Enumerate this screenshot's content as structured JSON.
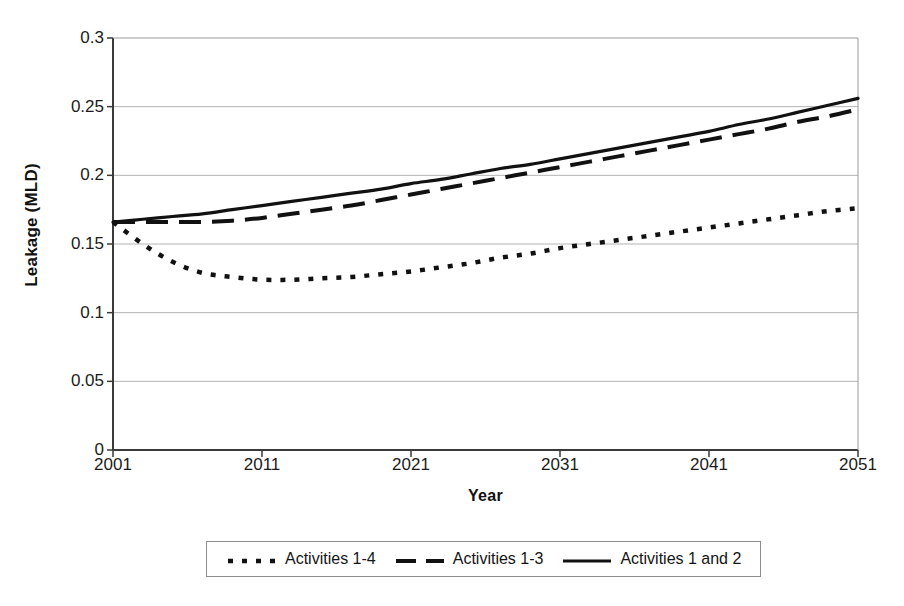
{
  "chart_data": {
    "type": "line",
    "title": "",
    "xlabel": "Year",
    "ylabel": "Leakage (MLD)",
    "xlim": [
      2001,
      2051
    ],
    "ylim": [
      0,
      0.3
    ],
    "grid": true,
    "legend_position": "bottom",
    "x_ticks": [
      "2001",
      "2011",
      "2021",
      "2031",
      "2041",
      "2051"
    ],
    "y_ticks": [
      "0",
      "0.05",
      "0.1",
      "0.15",
      "0.2",
      "0.25",
      "0.3"
    ],
    "x": [
      2001,
      2003,
      2005,
      2007,
      2009,
      2011,
      2013,
      2015,
      2017,
      2019,
      2021,
      2023,
      2025,
      2027,
      2029,
      2031,
      2033,
      2035,
      2037,
      2039,
      2041,
      2043,
      2045,
      2047,
      2049,
      2051
    ],
    "series": [
      {
        "name": "Activities 1-4",
        "style": "dotted",
        "color": "#111111",
        "values": [
          0.166,
          0.15,
          0.137,
          0.129,
          0.126,
          0.124,
          0.124,
          0.125,
          0.126,
          0.128,
          0.13,
          0.133,
          0.136,
          0.14,
          0.143,
          0.147,
          0.15,
          0.153,
          0.156,
          0.159,
          0.162,
          0.165,
          0.168,
          0.171,
          0.174,
          0.176
        ]
      },
      {
        "name": "Activities 1-3",
        "style": "dashed",
        "color": "#111111",
        "values": [
          0.166,
          0.166,
          0.166,
          0.166,
          0.167,
          0.169,
          0.172,
          0.175,
          0.178,
          0.182,
          0.186,
          0.19,
          0.194,
          0.198,
          0.202,
          0.206,
          0.21,
          0.214,
          0.218,
          0.222,
          0.226,
          0.23,
          0.234,
          0.239,
          0.243,
          0.248
        ]
      },
      {
        "name": "Activities 1 and 2",
        "style": "solid",
        "color": "#111111",
        "values": [
          0.166,
          0.168,
          0.17,
          0.172,
          0.175,
          0.178,
          0.181,
          0.184,
          0.187,
          0.19,
          0.194,
          0.197,
          0.201,
          0.205,
          0.208,
          0.212,
          0.216,
          0.22,
          0.224,
          0.228,
          0.232,
          0.237,
          0.241,
          0.246,
          0.251,
          0.256
        ]
      }
    ]
  },
  "axis": {
    "y_title": "Leakage (MLD)",
    "x_title": "Year"
  },
  "legend": {
    "entries": [
      {
        "label": "Activities 1-4",
        "swatch": "dotted-line-swatch"
      },
      {
        "label": "Activities 1-3",
        "swatch": "dashed-line-swatch"
      },
      {
        "label": "Activities 1 and 2",
        "swatch": "solid-line-swatch"
      }
    ]
  }
}
